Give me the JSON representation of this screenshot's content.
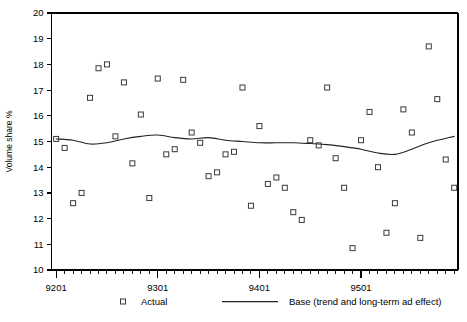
{
  "chart_data": {
    "type": "scatter",
    "title": "",
    "xlabel": "",
    "ylabel": "Volume share %",
    "ylim": [
      10,
      20
    ],
    "xlim": [
      9201,
      9512
    ],
    "grid": false,
    "legend_position": "bottom",
    "y_ticks": [
      10,
      11,
      12,
      13,
      14,
      15,
      16,
      17,
      18,
      19,
      20
    ],
    "x_ticks": [
      9201,
      9301,
      9401,
      9501
    ],
    "x_tick_labels": [
      "9201",
      "9301",
      "9401",
      "9501"
    ],
    "x_minor_tick_interval_months": 1,
    "series": [
      {
        "name": "Actual",
        "type": "scatter",
        "marker": "open-square",
        "x": [
          9201,
          9202,
          9203,
          9204,
          9205,
          9206,
          9207,
          9208,
          9209,
          9210,
          9211,
          9212,
          9301,
          9302,
          9303,
          9304,
          9305,
          9306,
          9307,
          9308,
          9309,
          9310,
          9311,
          9312,
          9401,
          9402,
          9403,
          9404,
          9405,
          9406,
          9407,
          9408,
          9409,
          9410,
          9411,
          9412,
          9501,
          9502,
          9503,
          9504,
          9505,
          9506,
          9507,
          9508,
          9509,
          9510,
          9511,
          9512
        ],
        "values": [
          15.1,
          14.75,
          12.6,
          13.0,
          16.7,
          17.85,
          18.0,
          15.2,
          17.3,
          14.15,
          16.05,
          12.8,
          17.45,
          14.5,
          14.7,
          17.4,
          15.35,
          14.95,
          13.65,
          13.8,
          14.5,
          14.6,
          17.1,
          12.5,
          15.6,
          13.35,
          13.6,
          13.2,
          12.25,
          11.95,
          15.05,
          14.85,
          17.1,
          14.35,
          13.2,
          10.85,
          15.05,
          16.15,
          14.0,
          11.45,
          12.6,
          16.25,
          15.35,
          11.25,
          18.7,
          16.65,
          14.3,
          13.2
        ]
      },
      {
        "name": "Base (trend and long-term ad effect)",
        "type": "line",
        "x": [
          9201,
          9203,
          9205,
          9207,
          9209,
          9211,
          9301,
          9303,
          9305,
          9307,
          9309,
          9311,
          9401,
          9403,
          9405,
          9407,
          9409,
          9411,
          9501,
          9503,
          9505,
          9507,
          9509,
          9512
        ],
        "values": [
          15.1,
          15.05,
          14.9,
          14.95,
          15.1,
          15.2,
          15.25,
          15.15,
          15.1,
          15.15,
          15.05,
          15.0,
          14.95,
          14.95,
          14.95,
          14.92,
          14.88,
          14.8,
          14.7,
          14.55,
          14.5,
          14.7,
          14.95,
          15.2
        ]
      }
    ]
  },
  "legend": {
    "items": [
      {
        "label": "Actual",
        "marker": "open-square"
      },
      {
        "label": "Base (trend and long-term ad effect)",
        "marker": "line"
      }
    ]
  },
  "axis": {
    "y_label": "Volume share %"
  }
}
